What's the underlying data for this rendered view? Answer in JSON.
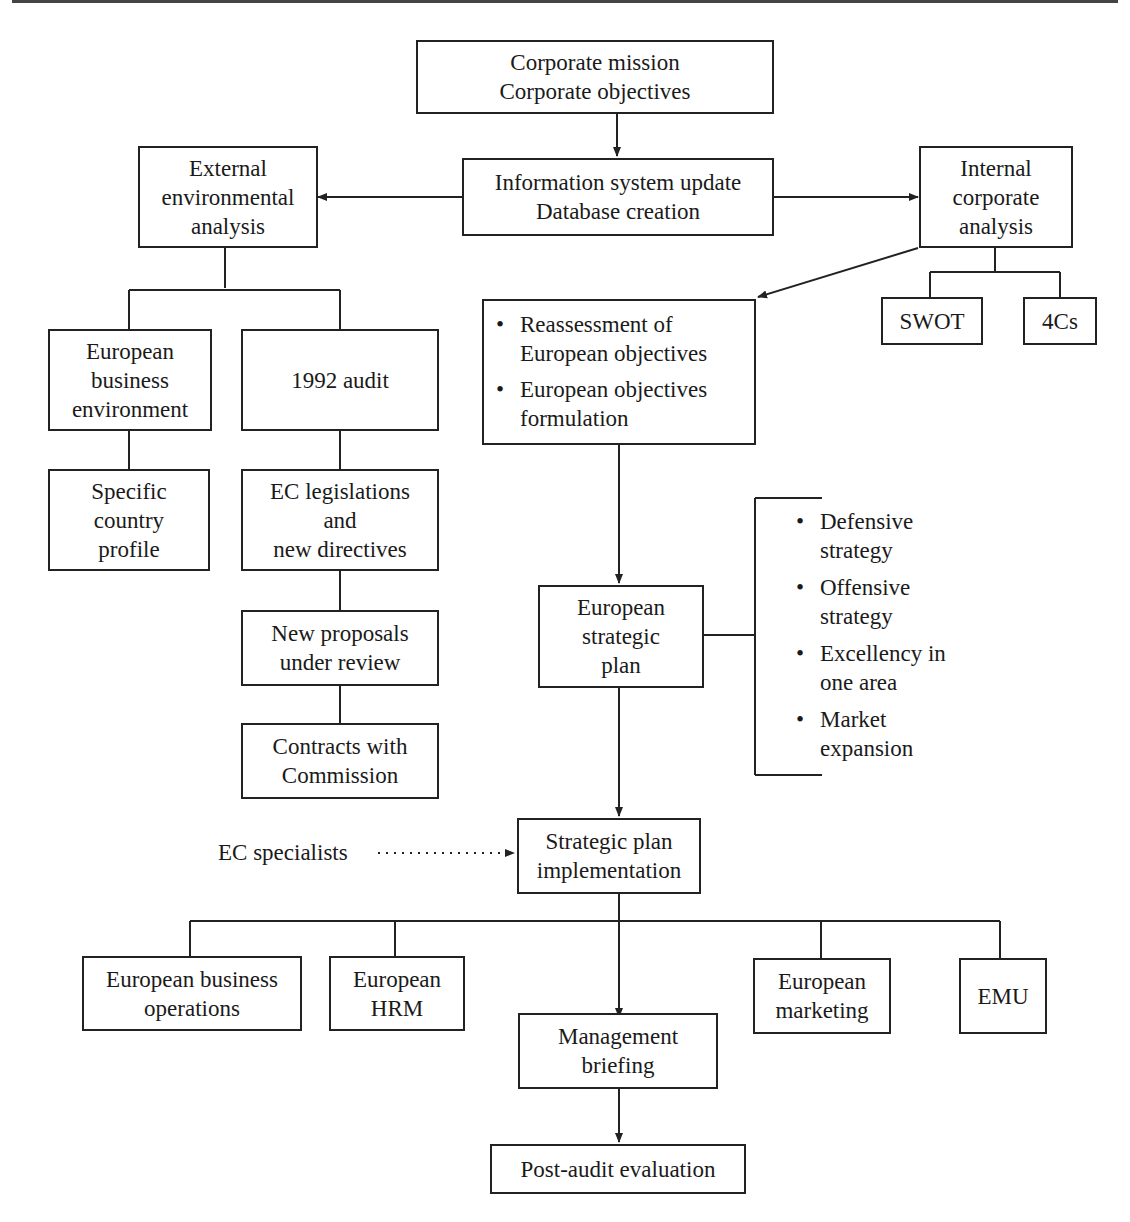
{
  "diagram": {
    "nodes": {
      "corporate_mission": {
        "lines": [
          "Corporate mission",
          "Corporate objectives"
        ]
      },
      "info_system": {
        "lines": [
          "Information system update",
          "Database creation"
        ]
      },
      "external_analysis": {
        "lines": [
          "External",
          "environmental",
          "analysis"
        ]
      },
      "internal_analysis": {
        "lines": [
          "Internal",
          "corporate",
          "analysis"
        ]
      },
      "swot": {
        "lines": [
          "SWOT"
        ]
      },
      "four_cs": {
        "lines": [
          "4Cs"
        ]
      },
      "european_business_env": {
        "lines": [
          "European",
          "business",
          "environment"
        ]
      },
      "audit_1992": {
        "lines": [
          "1992 audit"
        ]
      },
      "country_profile": {
        "lines": [
          "Specific",
          "country",
          "profile"
        ]
      },
      "ec_legislations": {
        "lines": [
          "EC legislations",
          "and",
          "new directives"
        ]
      },
      "new_proposals": {
        "lines": [
          "New proposals",
          "under review"
        ]
      },
      "contracts_commission": {
        "lines": [
          "Contracts with",
          "Commission"
        ]
      },
      "objectives_box": {
        "items": [
          {
            "bullet": "•",
            "lines": [
              "Reassessment of",
              "European objectives"
            ]
          },
          {
            "bullet": "•",
            "lines": [
              "European objectives",
              "formulation"
            ]
          }
        ]
      },
      "strategic_plan": {
        "lines": [
          "European",
          "strategic",
          "plan"
        ]
      },
      "strategy_options": {
        "items": [
          {
            "bullet": "•",
            "lines": [
              "Defensive",
              "strategy"
            ]
          },
          {
            "bullet": "•",
            "lines": [
              "Offensive",
              "strategy"
            ]
          },
          {
            "bullet": "•",
            "lines": [
              "Excellency in",
              "one area"
            ]
          },
          {
            "bullet": "•",
            "lines": [
              "Market",
              "expansion"
            ]
          }
        ]
      },
      "ec_specialists": {
        "label": "EC specialists"
      },
      "plan_implementation": {
        "lines": [
          "Strategic plan",
          "implementation"
        ]
      },
      "business_operations": {
        "lines": [
          "European business",
          "operations"
        ]
      },
      "hrm": {
        "lines": [
          "European",
          "HRM"
        ]
      },
      "marketing": {
        "lines": [
          "European",
          "marketing"
        ]
      },
      "emu": {
        "lines": [
          "EMU"
        ]
      },
      "management_briefing": {
        "lines": [
          "Management",
          "briefing"
        ]
      },
      "post_audit": {
        "lines": [
          "Post-audit evaluation"
        ]
      }
    },
    "colors": {
      "line": "#222222",
      "background": "#ffffff",
      "text": "#1a1a1a"
    }
  }
}
